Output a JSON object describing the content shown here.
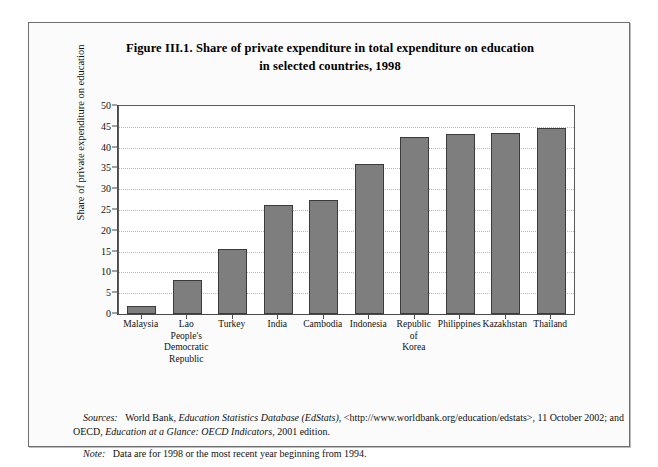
{
  "title": {
    "line1": "Figure III.1.   Share of private expenditure in total expenditure on education",
    "line2": "in selected countries, 1998"
  },
  "chart_data": {
    "type": "bar",
    "title": "Figure III.1. Share of private expenditure in total expenditure on education in selected countries, 1998",
    "xlabel": "",
    "ylabel": "Share of private expenditure on education",
    "ylim": [
      0,
      50
    ],
    "ytick_step": 5,
    "yticks": [
      "50",
      "45",
      "40",
      "35",
      "30",
      "25",
      "20",
      "15",
      "10",
      "5",
      "0"
    ],
    "grid": true,
    "legend": "none",
    "bar_color": "#7e7e7e",
    "bar_edge_color": "#3b3b3b",
    "categories": [
      "Malaysia",
      "Lao People's Democratic Republic",
      "Turkey",
      "India",
      "Cambodia",
      "Indonesia",
      "Republic of Korea",
      "Philippines",
      "Kazakhstan",
      "Thailand"
    ],
    "category_lines": [
      [
        "Malaysia"
      ],
      [
        "Lao",
        "People's",
        "Democratic",
        "Republic"
      ],
      [
        "Turkey"
      ],
      [
        "India"
      ],
      [
        "Cambodia"
      ],
      [
        "Indonesia"
      ],
      [
        "Republic",
        "of",
        "Korea"
      ],
      [
        "Philippines"
      ],
      [
        "Kazakhstan"
      ],
      [
        "Thailand"
      ]
    ],
    "values": [
      2.0,
      8.1,
      15.7,
      26.3,
      27.5,
      36.0,
      42.6,
      43.2,
      43.6,
      44.7
    ]
  },
  "notes": {
    "sources_label": "Sources:",
    "sources_text_1": "World Bank, ",
    "sources_italic_1": "Education Statistics Database (EdStats)",
    "sources_text_2": ", <http://www.worldbank.org/education/edstats>, 11 October 2002; and OECD, ",
    "sources_italic_2": "Education at a Glance: OECD Indicators,",
    "sources_text_3": " 2001 edition.",
    "note_label": "Note:",
    "note_text": "Data are for 1998 or the most recent year beginning from 1994."
  }
}
